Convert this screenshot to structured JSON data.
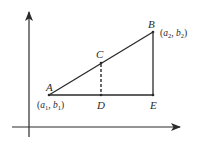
{
  "diagram": {
    "type": "coordinate-geometry",
    "colors": {
      "stroke": "#2a2a2a",
      "background": "#ffffff"
    },
    "axes": {
      "y_axis": {
        "x": 29,
        "y_top": 12,
        "y_bottom": 137,
        "arrow": "up"
      },
      "x_axis": {
        "y": 127,
        "x_left": 12,
        "x_right": 180,
        "arrow": "right"
      }
    },
    "points": {
      "A": {
        "label": "A",
        "x": 49,
        "y": 95,
        "coord_label": {
          "open": "(",
          "var1": "a",
          "sub1": "1",
          "sep": ", ",
          "var2": "b",
          "sub2": "1",
          "close": ")"
        }
      },
      "B": {
        "label": "B",
        "x": 153,
        "y": 32,
        "coord_label": {
          "open": "(",
          "var1": "a",
          "sub1": "2",
          "sep": ", ",
          "var2": "b",
          "sub2": "2",
          "close": ")"
        }
      },
      "C": {
        "label": "C",
        "x": 101,
        "y": 63
      },
      "D": {
        "label": "D",
        "x": 101,
        "y": 95
      },
      "E": {
        "label": "E",
        "x": 153,
        "y": 95
      }
    },
    "segments": [
      {
        "name": "AB",
        "from": "A",
        "to": "B",
        "style": "solid"
      },
      {
        "name": "AE",
        "from": "A",
        "to": "E",
        "style": "solid"
      },
      {
        "name": "BE",
        "from": "B",
        "to": "E",
        "style": "solid"
      },
      {
        "name": "CD",
        "from": "C",
        "to": "D",
        "style": "dashed"
      }
    ]
  }
}
